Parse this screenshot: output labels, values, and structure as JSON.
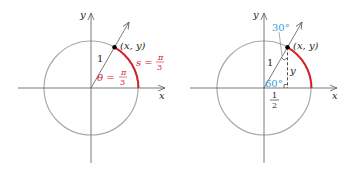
{
  "left_diagram": {
    "y_axis_label": "y",
    "x_axis_label": "x",
    "point_label": "(x, y)",
    "radius_label": "1",
    "angle_label_prefix": "θ =",
    "angle_num": "π",
    "angle_den": "3",
    "arc_label_prefix": "s =",
    "arc_num": "π",
    "arc_den": "3"
  },
  "right_diagram": {
    "y_axis_label": "y",
    "x_axis_label": "x",
    "point_label": "(x, y)",
    "radius_label": "1",
    "top_angle": "30°",
    "bottom_angle": "60°",
    "vertical_label": "y",
    "half_num": "1",
    "half_den": "2"
  },
  "colors": {
    "circle": "#a7a9ac",
    "axis": "#58595b",
    "arc": "#d2232a",
    "angle_blue": "#3a9bd5"
  }
}
